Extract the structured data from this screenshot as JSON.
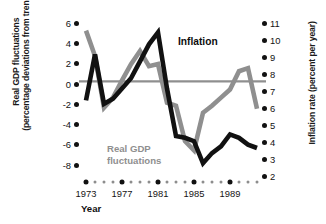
{
  "figure": {
    "background": "#ffffff",
    "inflation_color": "#111111",
    "realgdp_color": "#8f8f8f",
    "zero_line_color": "#8f8f8f"
  },
  "left_axis": {
    "title_line1": "Real GDP fluctuations",
    "title_line2": "(percentage deviations from trend)",
    "ticks": [
      "6",
      "4",
      "2",
      "0",
      "-2",
      "-4",
      "-6",
      "-8"
    ]
  },
  "right_axis": {
    "title_line1": "Inflation rate (percent per year)",
    "title_line2": "",
    "ticks": [
      "11",
      "10",
      "9",
      "8",
      "7",
      "6",
      "5",
      "4",
      "3",
      "2"
    ]
  },
  "x_axis": {
    "name": "Year",
    "labels": [
      "1973",
      "1977",
      "1981",
      "1985",
      "1989"
    ]
  },
  "series_labels": {
    "inflation": "Inflation",
    "realgdp_line1": "Real GDP",
    "realgdp_line2": "fluctuations"
  },
  "chart_data": {
    "type": "line",
    "title": "",
    "xlabel": "Year",
    "ylabel": "Real GDP fluctuations (percentage deviations from trend)",
    "y2label": "Inflation rate (percent per year)",
    "grid": false,
    "legend": "inline-annotations",
    "xlim": [
      1973,
      1992
    ],
    "ylim": [
      -8,
      6
    ],
    "y2lim": [
      2,
      11
    ],
    "x": [
      1973,
      1974,
      1975,
      1976,
      1977,
      1978,
      1979,
      1980,
      1981,
      1982,
      1983,
      1984,
      1985,
      1986,
      1987,
      1988,
      1989,
      1990,
      1991,
      1992
    ],
    "xticks": [
      1973,
      1977,
      1981,
      1985,
      1989
    ],
    "series": [
      {
        "name": "Real GDP fluctuations",
        "axis": "left",
        "color": "#8f8f8f",
        "units": "percentage deviations from trend",
        "values": [
          5.0,
          2.5,
          -2.6,
          -1.6,
          0.1,
          1.7,
          3.0,
          1.5,
          1.7,
          -2.1,
          -2.4,
          -5.9,
          -6.8,
          -3.1,
          -2.4,
          -1.6,
          -0.8,
          1.0,
          1.3,
          -2.7
        ]
      },
      {
        "name": "Inflation",
        "axis": "right",
        "color": "#111111",
        "units": "percent per year",
        "values": [
          6.3,
          9.0,
          6.1,
          6.4,
          7.0,
          7.6,
          8.6,
          9.6,
          10.3,
          7.0,
          4.2,
          4.1,
          3.9,
          2.6,
          3.2,
          3.6,
          4.3,
          4.1,
          3.7,
          3.5
        ]
      }
    ]
  }
}
